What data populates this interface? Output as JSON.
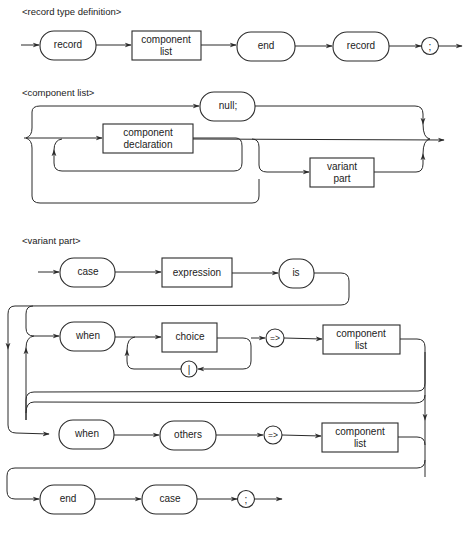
{
  "diagrams": [
    {
      "title": "<record type definition>",
      "nodes": [
        {
          "type": "terminal",
          "label": "record"
        },
        {
          "type": "nonterminal",
          "label_line1": "component",
          "label_line2": "list"
        },
        {
          "type": "terminal",
          "label": "end"
        },
        {
          "type": "terminal",
          "label": "record"
        },
        {
          "type": "symbol",
          "label": ";"
        }
      ]
    },
    {
      "title": "<component list>",
      "nodes": [
        {
          "type": "terminal",
          "label": "null;"
        },
        {
          "type": "nonterminal",
          "label_line1": "component",
          "label_line2": "declaration"
        },
        {
          "type": "nonterminal",
          "label_line1": "variant",
          "label_line2": "part"
        }
      ]
    },
    {
      "title": "<variant part>",
      "nodes": [
        {
          "type": "terminal",
          "label": "case"
        },
        {
          "type": "nonterminal",
          "label": "expression"
        },
        {
          "type": "terminal",
          "label": "is"
        },
        {
          "type": "terminal",
          "label": "when"
        },
        {
          "type": "nonterminal",
          "label": "choice"
        },
        {
          "type": "symbol",
          "label": "|"
        },
        {
          "type": "symbol",
          "label": "=>"
        },
        {
          "type": "nonterminal",
          "label_line1": "component",
          "label_line2": "list"
        },
        {
          "type": "terminal",
          "label": "when"
        },
        {
          "type": "terminal",
          "label": "others"
        },
        {
          "type": "symbol",
          "label": "=>"
        },
        {
          "type": "nonterminal",
          "label_line1": "component",
          "label_line2": "list"
        },
        {
          "type": "terminal",
          "label": "end"
        },
        {
          "type": "terminal",
          "label": "case"
        },
        {
          "type": "symbol",
          "label": ";"
        }
      ]
    }
  ],
  "colors": {
    "line": "#2a2a2a",
    "background": "#ffffff"
  }
}
